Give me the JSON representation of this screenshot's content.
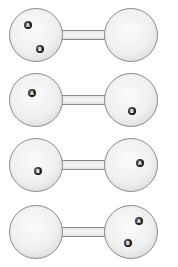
{
  "figure": {
    "colors": {
      "bulb_outline": "#8a8a8a",
      "bulb_fill": "#efefef",
      "particle": "#111111",
      "particle_label": "#ffffff"
    },
    "arrangements": [
      {
        "left": [
          "A",
          "B"
        ],
        "right": []
      },
      {
        "left": [
          "A"
        ],
        "right": [
          "B"
        ]
      },
      {
        "left": [
          "B"
        ],
        "right": [
          "A"
        ]
      },
      {
        "left": [],
        "right": [
          "A",
          "B"
        ]
      }
    ],
    "labels": {
      "a": "A",
      "b": "B"
    }
  }
}
